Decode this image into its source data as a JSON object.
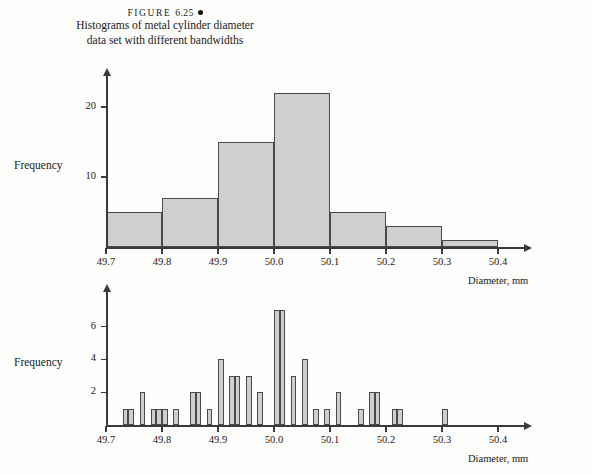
{
  "figure": {
    "label_prefix": "FIGURE",
    "label_number": "6.25",
    "caption_line1": "Histograms of metal cylinder diameter",
    "caption_line2": "data set with different bandwidths"
  },
  "colors": {
    "bar_fill": "#cfcfcd",
    "bar_stroke": "#4a4a4a",
    "axis": "#3a3a3a",
    "text": "#1a1a1a",
    "background": "#fdfdfb"
  },
  "chart_data": [
    {
      "id": "histogram-wide-bandwidth",
      "type": "bar",
      "title": "",
      "xlabel": "Diameter, mm",
      "ylabel": "Frequency",
      "bandwidth": 0.1,
      "xlim": [
        49.7,
        50.4
      ],
      "ylim": [
        0,
        23
      ],
      "grid": false,
      "legend": false,
      "x_ticks": [
        "49.7",
        "49.8",
        "49.9",
        "50.0",
        "50.1",
        "50.2",
        "50.3",
        "50.4"
      ],
      "x_tick_values": [
        49.7,
        49.8,
        49.9,
        50.0,
        50.1,
        50.2,
        50.3,
        50.4
      ],
      "y_ticks": [
        "10",
        "20"
      ],
      "y_tick_values": [
        10,
        20
      ],
      "bins": [
        {
          "start": 49.7,
          "end": 49.8,
          "value": 5
        },
        {
          "start": 49.8,
          "end": 49.9,
          "value": 7
        },
        {
          "start": 49.9,
          "end": 50.0,
          "value": 15
        },
        {
          "start": 50.0,
          "end": 50.1,
          "value": 22
        },
        {
          "start": 50.1,
          "end": 50.2,
          "value": 5
        },
        {
          "start": 50.2,
          "end": 50.3,
          "value": 3
        },
        {
          "start": 50.3,
          "end": 50.4,
          "value": 1
        }
      ]
    },
    {
      "id": "histogram-narrow-bandwidth",
      "type": "bar",
      "title": "",
      "xlabel": "Diameter, mm",
      "ylabel": "Frequency",
      "bandwidth": 0.01,
      "xlim": [
        49.7,
        50.4
      ],
      "ylim": [
        0,
        7.5
      ],
      "grid": false,
      "legend": false,
      "x_ticks": [
        "49.7",
        "49.8",
        "49.9",
        "50.0",
        "50.1",
        "50.2",
        "50.3",
        "50.4"
      ],
      "x_tick_values": [
        49.7,
        49.8,
        49.9,
        50.0,
        50.1,
        50.2,
        50.3,
        50.4
      ],
      "y_ticks": [
        "2",
        "4",
        "6"
      ],
      "y_tick_values": [
        2,
        4,
        6
      ],
      "bins": [
        {
          "start": 49.73,
          "end": 49.74,
          "value": 1
        },
        {
          "start": 49.74,
          "end": 49.75,
          "value": 1
        },
        {
          "start": 49.76,
          "end": 49.77,
          "value": 2
        },
        {
          "start": 49.78,
          "end": 49.79,
          "value": 1
        },
        {
          "start": 49.79,
          "end": 49.8,
          "value": 1
        },
        {
          "start": 49.8,
          "end": 49.81,
          "value": 1
        },
        {
          "start": 49.82,
          "end": 49.83,
          "value": 1
        },
        {
          "start": 49.85,
          "end": 49.86,
          "value": 2
        },
        {
          "start": 49.86,
          "end": 49.87,
          "value": 2
        },
        {
          "start": 49.88,
          "end": 49.89,
          "value": 1
        },
        {
          "start": 49.9,
          "end": 49.91,
          "value": 4
        },
        {
          "start": 49.92,
          "end": 49.93,
          "value": 3
        },
        {
          "start": 49.93,
          "end": 49.94,
          "value": 3
        },
        {
          "start": 49.95,
          "end": 49.96,
          "value": 3
        },
        {
          "start": 49.97,
          "end": 49.98,
          "value": 2
        },
        {
          "start": 50.0,
          "end": 50.01,
          "value": 7
        },
        {
          "start": 50.01,
          "end": 50.02,
          "value": 7
        },
        {
          "start": 50.03,
          "end": 50.04,
          "value": 3
        },
        {
          "start": 50.05,
          "end": 50.06,
          "value": 4
        },
        {
          "start": 50.07,
          "end": 50.08,
          "value": 1
        },
        {
          "start": 50.09,
          "end": 50.1,
          "value": 1
        },
        {
          "start": 50.11,
          "end": 50.12,
          "value": 2
        },
        {
          "start": 50.15,
          "end": 50.16,
          "value": 1
        },
        {
          "start": 50.17,
          "end": 50.18,
          "value": 2
        },
        {
          "start": 50.18,
          "end": 50.19,
          "value": 2
        },
        {
          "start": 50.21,
          "end": 50.22,
          "value": 1
        },
        {
          "start": 50.22,
          "end": 50.23,
          "value": 1
        },
        {
          "start": 50.3,
          "end": 50.31,
          "value": 1
        }
      ]
    }
  ]
}
